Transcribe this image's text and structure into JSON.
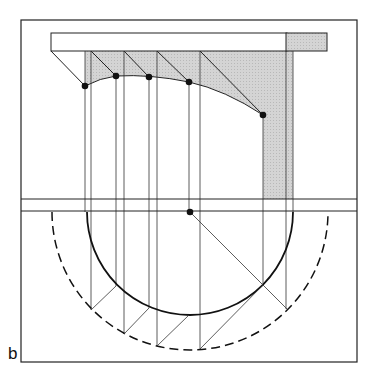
{
  "figure": {
    "label": "b",
    "colors": {
      "line": "#222222",
      "shade": "#cfcfcf",
      "background": "#ffffff"
    },
    "frame": {
      "x": 21,
      "y": 20,
      "w": 336,
      "h": 342
    },
    "center_point": [
      190,
      212
    ],
    "inner_radius": 103,
    "outer_radius": 138,
    "elevation_points": [
      [
        85,
        86
      ],
      [
        116,
        76
      ],
      [
        149,
        77
      ],
      [
        189,
        82
      ],
      [
        263,
        115
      ]
    ]
  }
}
